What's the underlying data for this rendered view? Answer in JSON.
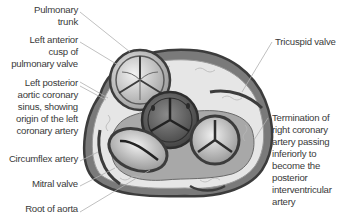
{
  "diagram": {
    "colors": {
      "outline": "#3c3c3c",
      "fat": "#e4e4e4",
      "tissue_mid": "#8a8a8a",
      "aortic_dark": "#5a5a5a",
      "leader_line": "#b0b0b0",
      "text": "#3a3a3a"
    },
    "labels_left": [
      {
        "id": "pulmonary-trunk",
        "lines": [
          "Pulmonary",
          "trunk"
        ]
      },
      {
        "id": "left-anterior-cusp",
        "lines": [
          "Left anterior",
          "cusp of",
          "pulmonary valve"
        ]
      },
      {
        "id": "left-posterior-sinus",
        "lines": [
          "Left posterior",
          "aortic coronary",
          "sinus, showing",
          "origin of the left",
          "coronary artery"
        ]
      },
      {
        "id": "circumflex-artery",
        "lines": [
          "Circumflex artery"
        ]
      },
      {
        "id": "mitral-valve",
        "lines": [
          "Mitral valve"
        ]
      },
      {
        "id": "root-of-aorta",
        "lines": [
          "Root of aorta"
        ]
      }
    ],
    "labels_right": [
      {
        "id": "tricuspid-valve",
        "lines": [
          "Tricuspid valve"
        ]
      },
      {
        "id": "termination-rca",
        "lines": [
          "Termination of",
          "right coronary",
          "artery passing",
          "inferiorly to",
          "become the",
          "posterior",
          "interventricular",
          "artery"
        ]
      }
    ]
  }
}
